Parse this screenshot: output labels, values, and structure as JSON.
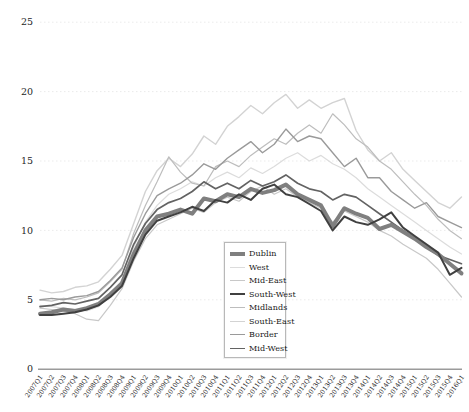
{
  "page": {
    "background": "#ffffff",
    "text_color": "#262626"
  },
  "chart_data": {
    "type": "line",
    "title": "",
    "xlabel": "",
    "ylabel": "",
    "ylim": [
      0,
      25
    ],
    "yticks": [
      0,
      5,
      10,
      15,
      20,
      25
    ],
    "grid": "horizontal-dotted",
    "grid_color": "#ebebeb",
    "axis_line_color": "#9b9b9b",
    "legend_position": "inside-lower-right",
    "x_labels": [
      "2007Q1",
      "2007Q2",
      "2007Q3",
      "2007Q4",
      "2008Q1",
      "2008Q2",
      "2008Q3",
      "2008Q4",
      "2009Q1",
      "2009Q2",
      "2009Q3",
      "2009Q4",
      "2010Q1",
      "2010Q2",
      "2010Q3",
      "2010Q4",
      "2011Q1",
      "2011Q2",
      "2011Q3",
      "2011Q4",
      "2012Q1",
      "2012Q2",
      "2012Q3",
      "2012Q4",
      "2013Q1",
      "2013Q2",
      "2013Q3",
      "2013Q4",
      "2014Q1",
      "2014Q2",
      "2014Q3",
      "2014Q4",
      "2015Q1",
      "2015Q2",
      "2015Q3",
      "2015Q4",
      "2016Q1"
    ],
    "series": [
      {
        "name": "Dublin",
        "color": "#7f7f7f",
        "width": 4,
        "values": [
          4.0,
          4.1,
          4.3,
          4.2,
          4.4,
          4.7,
          5.4,
          6.2,
          8.3,
          10.0,
          11.0,
          11.2,
          11.5,
          11.2,
          12.3,
          12.1,
          12.6,
          12.4,
          13.0,
          12.7,
          12.9,
          13.3,
          12.6,
          12.2,
          11.8,
          10.3,
          11.6,
          11.2,
          10.9,
          10.1,
          10.4,
          9.9,
          9.4,
          8.8,
          8.3,
          7.6,
          6.9
        ]
      },
      {
        "name": "West",
        "color": "#dcdcdc",
        "width": 1.2,
        "values": [
          4.6,
          4.5,
          4.4,
          4.3,
          4.2,
          4.5,
          5.3,
          6.4,
          8.8,
          10.6,
          11.8,
          12.6,
          13.0,
          13.5,
          13.2,
          13.8,
          14.2,
          13.8,
          14.5,
          14.1,
          14.6,
          15.2,
          15.6,
          15.0,
          15.4,
          14.8,
          14.4,
          13.8,
          13.0,
          12.4,
          11.8,
          11.2,
          10.6,
          10.0,
          9.4,
          8.8,
          8.3
        ]
      },
      {
        "name": "Mid-East",
        "color": "#c8c8c8",
        "width": 1.2,
        "values": [
          4.4,
          4.3,
          4.2,
          4.0,
          3.6,
          3.5,
          4.6,
          5.8,
          7.8,
          9.4,
          10.4,
          10.8,
          11.2,
          11.6,
          11.3,
          12.0,
          12.4,
          12.1,
          12.8,
          13.2,
          12.6,
          13.0,
          12.4,
          12.0,
          11.6,
          10.6,
          11.4,
          11.0,
          10.6,
          10.0,
          9.6,
          9.0,
          8.5,
          8.0,
          7.2,
          6.2,
          5.2
        ]
      },
      {
        "name": "South-West",
        "color": "#404040",
        "width": 2,
        "values": [
          3.9,
          3.9,
          4.0,
          4.1,
          4.3,
          4.6,
          5.2,
          6.0,
          8.0,
          9.7,
          10.7,
          11.0,
          11.3,
          11.7,
          11.4,
          12.2,
          12.0,
          12.6,
          12.2,
          13.0,
          13.3,
          12.6,
          12.4,
          11.9,
          11.4,
          10.0,
          11.0,
          10.6,
          10.4,
          10.8,
          11.3,
          10.2,
          9.6,
          9.0,
          8.4,
          6.8,
          7.3
        ]
      },
      {
        "name": "Midlands",
        "color": "#bdbdbd",
        "width": 1.2,
        "values": [
          5.0,
          4.9,
          5.1,
          5.0,
          5.2,
          5.5,
          6.3,
          7.2,
          9.8,
          11.8,
          13.5,
          15.3,
          14.2,
          13.4,
          13.2,
          14.6,
          15.0,
          14.6,
          15.4,
          16.0,
          16.6,
          16.2,
          17.0,
          17.6,
          17.0,
          18.4,
          17.6,
          16.6,
          16.0,
          15.0,
          14.4,
          13.5,
          12.6,
          11.8,
          10.8,
          10.0,
          9.4
        ]
      },
      {
        "name": "South-East",
        "color": "#d3d3d3",
        "width": 1.4,
        "values": [
          5.7,
          5.5,
          5.6,
          5.9,
          6.0,
          6.3,
          7.2,
          8.2,
          10.5,
          12.8,
          14.3,
          15.2,
          14.6,
          15.5,
          16.8,
          16.2,
          17.5,
          18.2,
          19.0,
          18.4,
          19.2,
          19.8,
          18.8,
          19.4,
          18.8,
          19.2,
          19.5,
          17.2,
          15.8,
          15.0,
          15.6,
          14.4,
          13.6,
          12.8,
          12.0,
          11.6,
          12.4
        ]
      },
      {
        "name": "Border",
        "color": "#9a9a9a",
        "width": 1.4,
        "values": [
          5.0,
          5.1,
          5.0,
          5.2,
          5.3,
          5.6,
          6.4,
          7.3,
          9.5,
          11.2,
          12.5,
          13.0,
          13.4,
          14.0,
          14.8,
          14.4,
          15.2,
          15.8,
          16.4,
          15.6,
          16.2,
          17.3,
          16.4,
          16.8,
          16.6,
          15.6,
          14.6,
          15.2,
          13.8,
          13.8,
          12.8,
          12.2,
          11.6,
          12.0,
          11.0,
          10.6,
          10.2
        ]
      },
      {
        "name": "Mid-West",
        "color": "#636363",
        "width": 1.7,
        "values": [
          4.5,
          4.6,
          4.8,
          4.7,
          4.9,
          5.1,
          5.9,
          6.8,
          9.0,
          10.5,
          11.5,
          12.0,
          12.3,
          12.8,
          13.5,
          13.0,
          13.4,
          13.0,
          13.6,
          13.2,
          13.5,
          14.0,
          13.4,
          13.0,
          12.8,
          12.2,
          12.6,
          12.4,
          11.8,
          11.2,
          10.6,
          10.0,
          9.4,
          8.8,
          8.2,
          7.9,
          7.6
        ]
      }
    ],
    "legend": [
      "Dublin",
      "West",
      "Mid-East",
      "South-West",
      "Midlands",
      "South-East",
      "Border",
      "Mid-West"
    ]
  }
}
